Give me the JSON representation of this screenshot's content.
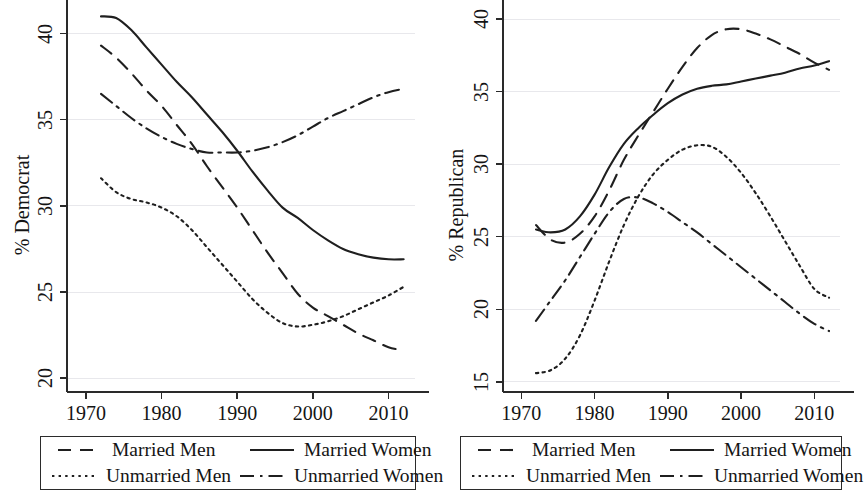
{
  "figure": {
    "panels": [
      {
        "id": "democrat",
        "ylabel": "% Democrat",
        "xticks": [
          "1970",
          "1980",
          "1990",
          "2000",
          "2010"
        ],
        "yticks": [
          "20",
          "25",
          "30",
          "35",
          "40"
        ]
      },
      {
        "id": "republican",
        "ylabel": "% Republican",
        "xticks": [
          "1970",
          "1980",
          "1990",
          "2000",
          "2010"
        ],
        "yticks": [
          "15",
          "20",
          "25",
          "30",
          "35",
          "40"
        ]
      }
    ],
    "legend": {
      "married_men": "Married Men",
      "married_women": "Married Women",
      "unmarried_men": "Unmarried Men",
      "unmarried_women": "Unmarried Women"
    },
    "colors": {
      "ink": "#1f1f1f",
      "grid": "#e8e8ec",
      "background": "#ffffff"
    }
  },
  "chart_data": [
    {
      "type": "line",
      "title": "",
      "xlabel": "",
      "ylabel": "% Democrat",
      "xlim": [
        1967.5,
        2013.5
      ],
      "ylim": [
        19.2,
        41.6
      ],
      "grid": true,
      "legend_position": "below",
      "xticks": [
        1970,
        1980,
        1990,
        2000,
        2010
      ],
      "yticks": [
        20,
        25,
        30,
        35,
        40
      ],
      "series": [
        {
          "name": "Married Men",
          "style": "dashed",
          "x": [
            1972,
            1974,
            1976,
            1978,
            1980,
            1982,
            1984,
            1986,
            1988,
            1990,
            1992,
            1994,
            1996,
            1998,
            2000,
            2002,
            2004,
            2006,
            2008,
            2010,
            2012
          ],
          "values": [
            39.3,
            38.6,
            37.7,
            36.7,
            35.8,
            34.7,
            33.6,
            32.3,
            31.1,
            29.9,
            28.6,
            27.3,
            26.1,
            24.9,
            24.1,
            23.6,
            23.1,
            22.6,
            22.2,
            21.8,
            21.6
          ]
        },
        {
          "name": "Married Women",
          "style": "solid",
          "x": [
            1972,
            1974,
            1976,
            1978,
            1980,
            1982,
            1984,
            1986,
            1988,
            1990,
            1992,
            1994,
            1996,
            1998,
            2000,
            2002,
            2004,
            2006,
            2008,
            2010,
            2012
          ],
          "values": [
            41.0,
            40.9,
            40.2,
            39.2,
            38.2,
            37.2,
            36.3,
            35.3,
            34.3,
            33.2,
            32.0,
            30.9,
            29.9,
            29.3,
            28.6,
            28.0,
            27.5,
            27.2,
            27.0,
            26.9,
            26.9
          ]
        },
        {
          "name": "Unmarried Men",
          "style": "dotted",
          "x": [
            1972,
            1974,
            1976,
            1978,
            1980,
            1982,
            1984,
            1986,
            1988,
            1990,
            1992,
            1994,
            1996,
            1998,
            2000,
            2002,
            2004,
            2006,
            2008,
            2010,
            2012
          ],
          "values": [
            31.6,
            30.8,
            30.4,
            30.2,
            29.9,
            29.4,
            28.6,
            27.6,
            26.6,
            25.6,
            24.6,
            23.8,
            23.2,
            23.0,
            23.1,
            23.3,
            23.6,
            24.0,
            24.4,
            24.8,
            25.3
          ]
        },
        {
          "name": "Unmarried Women",
          "style": "dash-dot",
          "x": [
            1972,
            1974,
            1976,
            1978,
            1980,
            1982,
            1984,
            1986,
            1988,
            1990,
            1992,
            1994,
            1996,
            1998,
            2000,
            2002,
            2004,
            2006,
            2008,
            2010,
            2012
          ],
          "values": [
            36.5,
            35.8,
            35.1,
            34.5,
            34.0,
            33.6,
            33.3,
            33.1,
            33.1,
            33.1,
            33.2,
            33.4,
            33.7,
            34.1,
            34.6,
            35.1,
            35.5,
            35.9,
            36.3,
            36.6,
            36.8
          ]
        }
      ]
    },
    {
      "type": "line",
      "title": "",
      "xlabel": "",
      "ylabel": "% Republican",
      "xlim": [
        1967.5,
        2013.5
      ],
      "ylim": [
        14.3,
        40.9
      ],
      "grid": true,
      "legend_position": "below",
      "xticks": [
        1970,
        1980,
        1990,
        2000,
        2010
      ],
      "yticks": [
        15,
        20,
        25,
        30,
        35,
        40
      ],
      "series": [
        {
          "name": "Married Men",
          "style": "dashed",
          "x": [
            1972,
            1974,
            1976,
            1978,
            1980,
            1982,
            1984,
            1986,
            1988,
            1990,
            1992,
            1994,
            1996,
            1998,
            2000,
            2002,
            2004,
            2006,
            2008,
            2010,
            2012
          ],
          "values": [
            25.8,
            24.8,
            24.6,
            25.2,
            26.4,
            28.2,
            30.3,
            32.0,
            33.6,
            35.2,
            36.7,
            38.0,
            38.9,
            39.3,
            39.3,
            39.0,
            38.6,
            38.1,
            37.6,
            37.0,
            36.5
          ]
        },
        {
          "name": "Married Women",
          "style": "solid",
          "x": [
            1972,
            1974,
            1976,
            1978,
            1980,
            1982,
            1984,
            1986,
            1988,
            1990,
            1992,
            1994,
            1996,
            1998,
            2000,
            2002,
            2004,
            2006,
            2008,
            2010,
            2012
          ],
          "values": [
            25.5,
            25.3,
            25.5,
            26.4,
            27.9,
            29.8,
            31.4,
            32.5,
            33.4,
            34.2,
            34.8,
            35.2,
            35.4,
            35.5,
            35.7,
            35.9,
            36.1,
            36.3,
            36.6,
            36.8,
            37.1
          ]
        },
        {
          "name": "Unmarried Men",
          "style": "dotted",
          "x": [
            1972,
            1974,
            1976,
            1978,
            1980,
            1982,
            1984,
            1986,
            1988,
            1990,
            1992,
            1994,
            1996,
            1998,
            2000,
            2002,
            2004,
            2006,
            2008,
            2010,
            2012
          ],
          "values": [
            15.6,
            15.8,
            16.6,
            18.2,
            20.6,
            23.3,
            25.8,
            27.8,
            29.3,
            30.3,
            31.0,
            31.3,
            31.2,
            30.5,
            29.4,
            28.0,
            26.4,
            24.7,
            23.0,
            21.4,
            20.8
          ]
        },
        {
          "name": "Unmarried Women",
          "style": "dash-dot",
          "x": [
            1972,
            1974,
            1976,
            1978,
            1980,
            1982,
            1984,
            1986,
            1988,
            1990,
            1992,
            1994,
            1996,
            1998,
            2000,
            2002,
            2004,
            2006,
            2008,
            2010,
            2012
          ],
          "values": [
            19.2,
            20.6,
            22.0,
            23.6,
            25.2,
            26.7,
            27.6,
            27.7,
            27.3,
            26.7,
            26.0,
            25.3,
            24.5,
            23.7,
            22.9,
            22.1,
            21.3,
            20.5,
            19.7,
            19.0,
            18.5
          ]
        }
      ]
    }
  ]
}
